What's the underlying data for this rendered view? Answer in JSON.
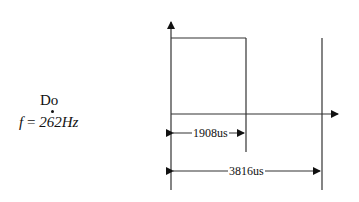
{
  "note": {
    "name": "Do",
    "frequency_prefix": "f",
    "frequency_equals": "=",
    "frequency_value": "262Hz"
  },
  "waveform": {
    "half_period_label": "1908us",
    "period_label": "3816us",
    "line_color": "#333333"
  }
}
